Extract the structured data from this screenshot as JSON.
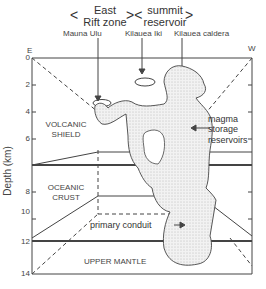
{
  "top_labels": {
    "east_rift_zone": "East\nRift zone",
    "east_rift_line1": "East",
    "east_rift_line2": "Rift zone",
    "summit_line1": "summit",
    "summit_line2": "reservoir",
    "mauna_ulu": "Mauna Ulu",
    "kilauea_iki": "Kilauea Iki",
    "kilauea_caldera": "Kilauea caldera"
  },
  "direction": {
    "east": "E",
    "west": "W"
  },
  "axis": {
    "label": "Depth (km)",
    "ticks": [
      "0",
      "2",
      "4",
      "6",
      "8",
      "10",
      "12",
      "14"
    ]
  },
  "layers": {
    "volcanic_shield_1": "VOLCANIC",
    "volcanic_shield_2": "SHIELD",
    "oceanic_crust_1": "OCEANIC",
    "oceanic_crust_2": "CRUST",
    "upper_mantle": "UPPER MANTLE"
  },
  "annotations": {
    "magma_1": "magma",
    "magma_2": "storage",
    "magma_3": "reservoirs",
    "primary_conduit": "primary conduit"
  },
  "colors": {
    "ink": "#333333",
    "fill": "#eeeeee",
    "background": "#ffffff"
  }
}
